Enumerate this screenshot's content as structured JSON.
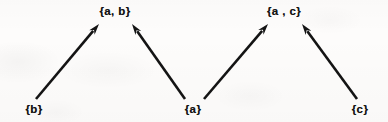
{
  "figure": {
    "kind": "hasse-diagram",
    "background_color": "#fdfcfb",
    "ink_color": "#141414",
    "width": 388,
    "height": 122
  },
  "nodes": [
    {
      "id": "ab",
      "label": "{a, b}",
      "x": 115,
      "y": 12,
      "level": "upper"
    },
    {
      "id": "ac",
      "label": "{a , c}",
      "x": 284,
      "y": 12,
      "level": "upper"
    },
    {
      "id": "b",
      "label": "{b}",
      "x": 34,
      "y": 110,
      "level": "lower"
    },
    {
      "id": "a",
      "label": "{a}",
      "x": 193,
      "y": 110,
      "level": "lower"
    },
    {
      "id": "c",
      "label": "{c}",
      "x": 360,
      "y": 110,
      "level": "lower"
    }
  ],
  "edges": [
    {
      "id": "b-to-ab",
      "from": "b",
      "to": "ab",
      "arrow": "to",
      "x1": 36,
      "y1": 99,
      "x2": 99,
      "y2": 24
    },
    {
      "id": "a-to-ab",
      "from": "a",
      "to": "ab",
      "arrow": "to",
      "x1": 185,
      "y1": 99,
      "x2": 132,
      "y2": 24
    },
    {
      "id": "a-to-ac",
      "from": "a",
      "to": "ac",
      "arrow": "to",
      "x1": 204,
      "y1": 99,
      "x2": 268,
      "y2": 24
    },
    {
      "id": "c-to-ac",
      "from": "c",
      "to": "ac",
      "arrow": "to",
      "x1": 357,
      "y1": 99,
      "x2": 302,
      "y2": 24
    }
  ],
  "style": {
    "edge_width": 2.6,
    "arrowhead_length": 11,
    "arrowhead_width": 7
  }
}
